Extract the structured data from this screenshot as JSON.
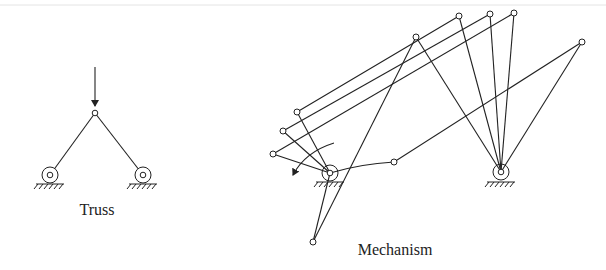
{
  "diagrams": [
    {
      "id": "truss",
      "label": "Truss",
      "load_arrow": {
        "from": [
          95,
          67
        ],
        "to": [
          95,
          108
        ]
      },
      "joint": [
        95,
        113
      ],
      "supports": [
        [
          50,
          175
        ],
        [
          143,
          175
        ]
      ]
    },
    {
      "id": "mechanism",
      "label": "Mechanism",
      "crank_pivot": [
        330,
        173
      ],
      "rocker_pivot": [
        501,
        172
      ],
      "configurations": [
        {
          "crank_end": [
            297,
            112
          ],
          "rocker_end": [
            459,
            16
          ]
        },
        {
          "crank_end": [
            283,
            131
          ],
          "rocker_end": [
            490,
            14
          ]
        },
        {
          "crank_end": [
            273,
            154
          ],
          "rocker_end": [
            514,
            13
          ]
        },
        {
          "crank_end": [
            313,
            242
          ],
          "rocker_end": [
            416,
            37
          ]
        },
        {
          "crank_end": [
            394,
            162
          ],
          "rocker_end": [
            582,
            42
          ]
        }
      ],
      "rotation_arrow": "counterclockwise"
    }
  ],
  "colors": {
    "line": "#222222",
    "background": "#ffffff"
  }
}
